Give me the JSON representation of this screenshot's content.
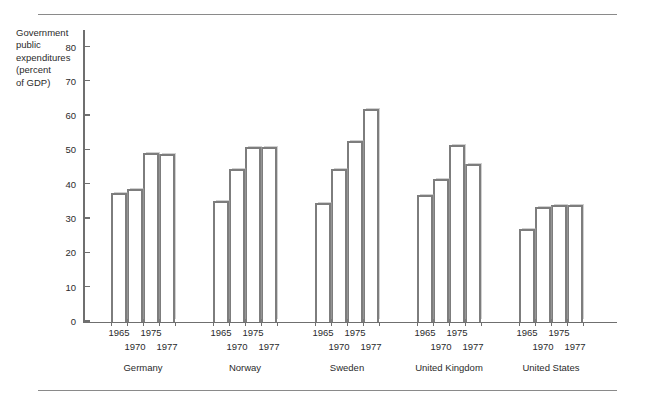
{
  "axis_label": "Government\npublic\nexpenditures\n(percent\nof GDP)",
  "chart_data": {
    "type": "bar",
    "title": "",
    "xlabel": "",
    "ylabel": "Government public expenditures (percent of GDP)",
    "ylim": [
      0,
      85
    ],
    "yticks": [
      0,
      10,
      20,
      30,
      40,
      50,
      60,
      70,
      80
    ],
    "ytick_labels": [
      "0",
      "10",
      "20",
      "30",
      "40",
      "50",
      "60",
      "70",
      "80"
    ],
    "grid": false,
    "legend": "none",
    "categories": [
      "Germany",
      "Norway",
      "Sweden",
      "United Kingdom",
      "United States"
    ],
    "x": [
      "1965",
      "1970",
      "1975",
      "1977"
    ],
    "groups": [
      {
        "name": "Germany",
        "years": [
          "1965",
          "1970",
          "1975",
          "1977"
        ],
        "values": [
          37.5,
          38.5,
          49.0,
          48.8
        ]
      },
      {
        "name": "Norway",
        "years": [
          "1965",
          "1970",
          "1975",
          "1977"
        ],
        "values": [
          35.0,
          44.5,
          50.8,
          51.0
        ]
      },
      {
        "name": "Sweden",
        "years": [
          "1965",
          "1970",
          "1975",
          "1977"
        ],
        "values": [
          34.5,
          44.5,
          52.5,
          62.0
        ]
      },
      {
        "name": "United Kingdom",
        "years": [
          "1965",
          "1970",
          "1975",
          "1977"
        ],
        "values": [
          36.8,
          41.5,
          51.5,
          46.0
        ]
      },
      {
        "name": "United States",
        "years": [
          "1965",
          "1970",
          "1975",
          "1977"
        ],
        "values": [
          27.0,
          33.3,
          34.0,
          34.0
        ]
      }
    ]
  },
  "colors": {
    "bar_outline": "#7d7d7d",
    "bar_fill": "#ffffff",
    "axis": "#6f6f6f",
    "rule": "#8a8a8a",
    "text": "#2b2b2b"
  }
}
